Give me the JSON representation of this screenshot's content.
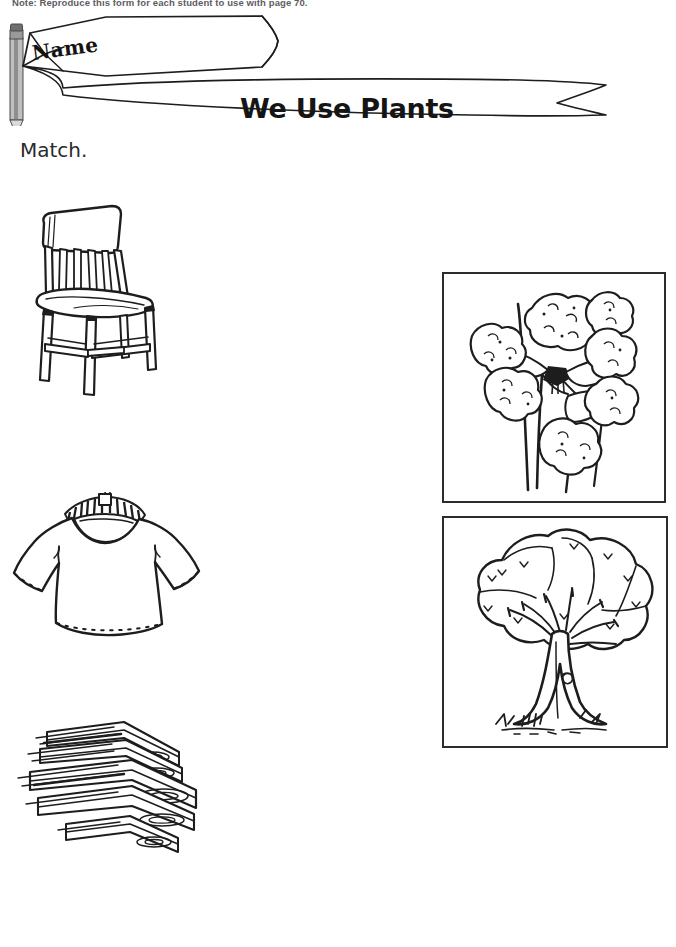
{
  "page": {
    "note": "Note: Reproduce this form for each student to use with page 70.",
    "name_label": "Name",
    "title": "We Use Plants",
    "directions": "Match.",
    "ink_color": "#1d1d1d",
    "paper_color": "#ffffff"
  },
  "left_column": {
    "items": [
      {
        "name": "chair",
        "icon": "wooden-chair-illustration",
        "alt": "Wooden chair with slatted back"
      },
      {
        "name": "shirt",
        "icon": "t-shirt-on-hanger-illustration",
        "alt": "T-shirt hanging on a hanger"
      },
      {
        "name": "lumber",
        "icon": "stacked-lumber-illustration",
        "alt": "Stack of wooden boards"
      }
    ]
  },
  "right_column": {
    "items": [
      {
        "name": "cotton",
        "icon": "cotton-plant-illustration",
        "alt": "Cotton plant with bolls"
      },
      {
        "name": "tree",
        "icon": "tree-illustration",
        "alt": "Broadleaf tree with grass"
      }
    ]
  }
}
